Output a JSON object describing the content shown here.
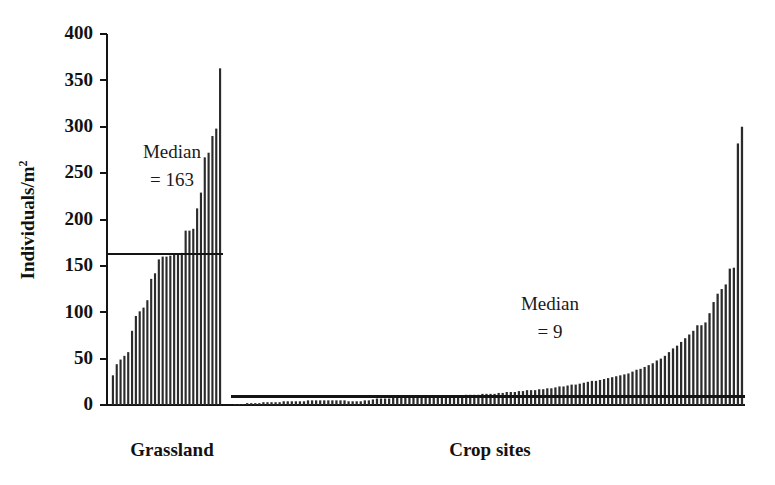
{
  "figure": {
    "background_color": "#ffffff",
    "foreground_color": "#141414",
    "bar_color": "#2b2b2b"
  },
  "chart_data": {
    "type": "bar",
    "title": "",
    "xlabel": "",
    "ylabel": "Individuals/m",
    "ylabel_superscript": "2",
    "ylim": [
      0,
      400
    ],
    "yticks": [
      0,
      50,
      100,
      150,
      200,
      250,
      300,
      350,
      400
    ],
    "ytick_labels": [
      "0",
      "50",
      "100",
      "150",
      "200",
      "250",
      "300",
      "350",
      "400"
    ],
    "grid": false,
    "legend": "none",
    "group_labels": [
      "Grassland",
      "Crop sites"
    ],
    "annotations": [
      {
        "name": "grassland-median-annotation",
        "line1": "Median",
        "line2": "= 163",
        "value": 163,
        "group": "Grassland"
      },
      {
        "name": "crop-median-annotation",
        "line1": "Median",
        "line2": "= 9",
        "value": 9,
        "group": "Crop sites"
      }
    ],
    "series": [
      {
        "name": "Grassland",
        "median": 163,
        "values": [
          32,
          44,
          49,
          53,
          57,
          80,
          96,
          101,
          105,
          113,
          136,
          142,
          157,
          160,
          160,
          161,
          162,
          163,
          164,
          188,
          188,
          190,
          212,
          229,
          267,
          272,
          290,
          298,
          363
        ]
      },
      {
        "name": "Crop sites",
        "median": 9,
        "values": [
          1,
          1,
          1,
          2,
          2,
          2,
          2,
          3,
          3,
          3,
          3,
          3,
          4,
          4,
          4,
          4,
          4,
          4,
          5,
          5,
          5,
          5,
          5,
          5,
          5,
          5,
          5,
          5,
          4,
          4,
          4,
          4,
          5,
          5,
          6,
          7,
          7,
          7,
          7,
          8,
          8,
          8,
          8,
          8,
          8,
          9,
          9,
          9,
          9,
          9,
          9,
          9,
          10,
          10,
          10,
          10,
          10,
          11,
          11,
          11,
          11,
          12,
          12,
          12,
          12,
          13,
          13,
          14,
          14,
          14,
          15,
          15,
          16,
          16,
          16,
          17,
          17,
          18,
          18,
          19,
          20,
          20,
          21,
          22,
          22,
          23,
          24,
          25,
          26,
          26,
          27,
          28,
          29,
          30,
          31,
          32,
          33,
          34,
          36,
          38,
          39,
          41,
          43,
          45,
          48,
          50,
          53,
          57,
          61,
          64,
          68,
          72,
          76,
          80,
          86,
          86,
          89,
          99,
          111,
          120,
          125,
          130,
          147,
          148,
          282,
          300
        ]
      }
    ]
  }
}
